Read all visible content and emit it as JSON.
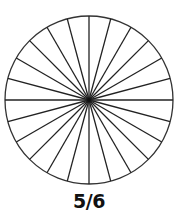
{
  "diagram": {
    "type": "fraction-circle",
    "sectors": 24,
    "fill_color": "#ffffff",
    "stroke_color": "#222222",
    "label": "5/6"
  }
}
